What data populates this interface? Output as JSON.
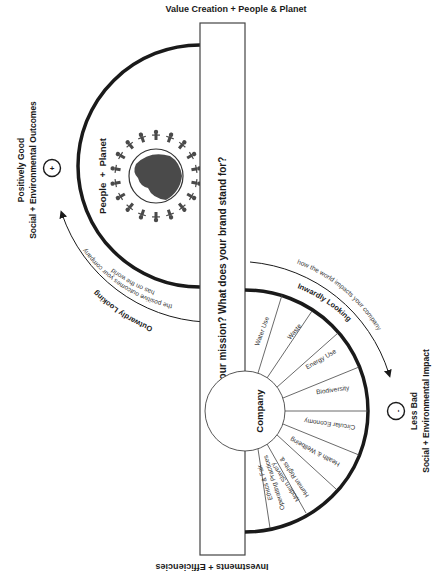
{
  "title_top": "Value Creation + People & Planet",
  "title_bottom": "Investments + Efficiencies",
  "center_box": {
    "question": "What is your mission? What does your brand stand for?"
  },
  "upper_half": {
    "label": "People  +  Planet",
    "side_label_line1": "Positively Good",
    "side_label_line2": "Social + Environmental Outcomes",
    "symbol": "+",
    "arrow_title": "Outwardly Looking",
    "arrow_text_line1": "the positive outcomes your company",
    "arrow_text_line2": "has on the world"
  },
  "lower_half": {
    "hub_label": "Company",
    "side_label_line1": "Less Bad",
    "side_label_line2": "Social + Environmental Impact",
    "symbol": "-",
    "arrow_title": "Inwardly Looking",
    "arrow_text": "how the world impacts your company",
    "segments": [
      {
        "label": "Water Use"
      },
      {
        "label": "Waste"
      },
      {
        "label": "Energy Use"
      },
      {
        "label": "Biodiversity"
      },
      {
        "label": "Circular Economy"
      },
      {
        "label": "Health & Wellbeing"
      },
      {
        "label_line1": "Human Rights &",
        "label_line2": "Modern Slavery"
      },
      {
        "label_line1": "Ethics & Fair",
        "label_line2": "Operating Practices"
      }
    ]
  },
  "colors": {
    "ink": "#1a1a1a",
    "globe": "#4a4a4a",
    "line": "#333333",
    "background": "#ffffff"
  }
}
